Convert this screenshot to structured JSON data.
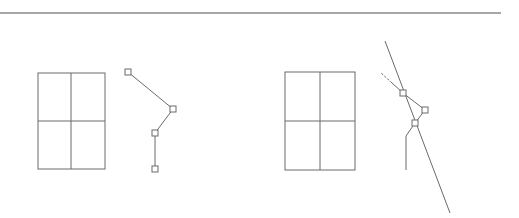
{
  "colors": {
    "background": "#ffffff",
    "stroke": "#6a6a6a",
    "rule": "#8a8a8a",
    "grip_fill": "#ffffff"
  },
  "top_rule": {
    "x1": 0,
    "y1": 13,
    "x2": 501,
    "y2": 13
  },
  "left_panel": {
    "rectangle": {
      "x": 38,
      "y": 73,
      "width": 67,
      "height": 96,
      "mid_x": 71,
      "mid_y": 121
    },
    "polyline": [
      [
        128,
        72
      ],
      [
        173,
        109
      ],
      [
        155,
        133
      ],
      [
        155,
        169
      ]
    ],
    "grips": [
      [
        128,
        72
      ],
      [
        173,
        109
      ],
      [
        155,
        133
      ],
      [
        155,
        169
      ]
    ]
  },
  "right_panel": {
    "rectangle": {
      "x": 285,
      "y": 72,
      "width": 70,
      "height": 98,
      "mid_x": 320,
      "mid_y": 121
    },
    "long_line": [
      [
        385,
        41
      ],
      [
        450,
        213
      ]
    ],
    "angled_line": [
      [
        380,
        72
      ],
      [
        403,
        93
      ],
      [
        425,
        110
      ]
    ],
    "dash_segment": [
      [
        380,
        72
      ],
      [
        392,
        83
      ]
    ],
    "connector": [
      [
        425,
        110
      ],
      [
        415,
        123
      ]
    ],
    "stub_line": [
      [
        415,
        123
      ],
      [
        406,
        136
      ],
      [
        406,
        170
      ]
    ],
    "grips": [
      [
        403,
        93
      ],
      [
        425,
        110
      ],
      [
        415,
        123
      ]
    ]
  }
}
